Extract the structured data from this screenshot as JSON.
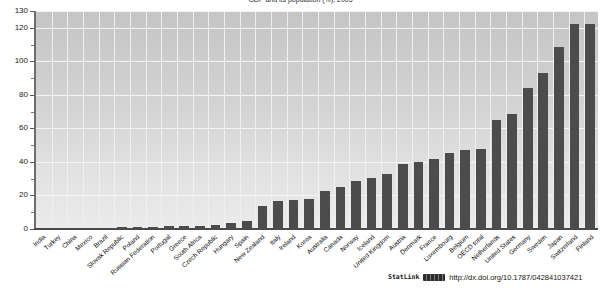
{
  "chart_data": {
    "type": "bar",
    "title": "GDP and its population (%), 2005",
    "xlabel": "",
    "ylabel": "",
    "ylim": [
      0,
      130
    ],
    "yticks": [
      0,
      20,
      40,
      60,
      80,
      100,
      120,
      130
    ],
    "ytick_labels": [
      "0",
      "20",
      "40",
      "60",
      "80",
      "100",
      "120",
      "130"
    ],
    "grid": true,
    "legend": "none",
    "bar_color": "#4c4c4c",
    "categories": [
      "India",
      "Turkey",
      "China",
      "Mexico",
      "Brazil",
      "Slovak Republic",
      "Poland",
      "Russian Federation",
      "Portugal",
      "Greece",
      "South Africa",
      "Czech Republic",
      "Hungary",
      "Spain",
      "New Zealand",
      "Italy",
      "Ireland",
      "Korea",
      "Australia",
      "Canada",
      "Norway",
      "Iceland",
      "United Kingdom",
      "Austria",
      "Denmark",
      "France",
      "Luxembourg",
      "Belgium",
      "OECD total",
      "Netherlands",
      "United States",
      "Germany",
      "Sweden",
      "Japan",
      "Switzerland",
      "Finland"
    ],
    "values": [
      0.3,
      0.4,
      0.5,
      0.6,
      0.8,
      1.0,
      1.2,
      1.4,
      1.6,
      1.8,
      2.0,
      2.2,
      3.5,
      4.5,
      13.5,
      16.5,
      17.5,
      18.0,
      22.5,
      25.0,
      28.5,
      30.5,
      33.0,
      38.5,
      40.0,
      42.0,
      45.5,
      47.0,
      48.0,
      65.0,
      68.5,
      84.0,
      93.0,
      108.5,
      122.0,
      122.5
    ]
  },
  "footer": {
    "statlink_label": "StatLink",
    "statlink_logo": "barcode-icon",
    "url": "http://dx.doi.org/10.1787/042841037421"
  }
}
